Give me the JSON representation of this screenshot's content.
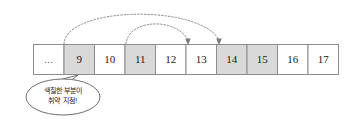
{
  "diagram": {
    "array": {
      "name": "index-array",
      "cells": [
        {
          "label": "...",
          "shaded": false
        },
        {
          "label": "9",
          "shaded": true
        },
        {
          "label": "10",
          "shaded": false
        },
        {
          "label": "11",
          "shaded": true
        },
        {
          "label": "12",
          "shaded": false
        },
        {
          "label": "13",
          "shaded": false
        },
        {
          "label": "14",
          "shaded": true
        },
        {
          "label": "15",
          "shaded": true
        },
        {
          "label": "16",
          "shaded": false
        },
        {
          "label": "17",
          "shaded": false
        }
      ]
    },
    "arcs": [
      {
        "name": "arc-9-to-14",
        "from_label": "9",
        "to_label": "14"
      },
      {
        "name": "arc-11-to-13",
        "from_label": "11",
        "to_label": "13"
      }
    ],
    "callout": {
      "name": "vulnerability-callout",
      "anchor_label": "9",
      "line1": "색칠한 부분이",
      "line2": "취약 지점!"
    },
    "colors": {
      "shaded_fill": "#d9d9d9",
      "cell_fill": "#ffffff",
      "cell_border": "#8c8c8c",
      "arc_stroke": "#8a8a8a",
      "bubble_border": "#6e6e6e",
      "text": "#1a1a1a"
    }
  }
}
